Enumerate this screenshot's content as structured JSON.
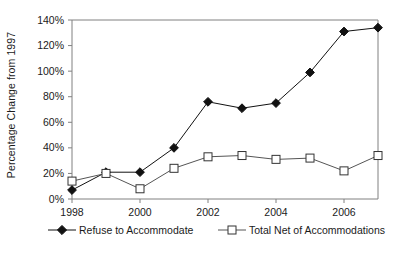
{
  "chart_data": {
    "type": "line",
    "title": "",
    "subtitle": "",
    "xlabel": "",
    "ylabel": "Percentage Change from 1997",
    "x": [
      1998,
      1999,
      2000,
      2001,
      2002,
      2003,
      2004,
      2005,
      2006,
      2007
    ],
    "xlim": [
      1998,
      2007
    ],
    "ylim": [
      0,
      140
    ],
    "ytick_labels": [
      "0%",
      "20%",
      "40%",
      "60%",
      "80%",
      "100%",
      "120%",
      "140%"
    ],
    "ytick_values": [
      0,
      20,
      40,
      60,
      80,
      100,
      120,
      140
    ],
    "xtick_labels": [
      "1998",
      "2000",
      "2002",
      "2004",
      "2006"
    ],
    "xtick_values": [
      1998,
      2000,
      2002,
      2004,
      2006
    ],
    "grid": false,
    "legend_position": "bottom",
    "series": [
      {
        "name": "Refuse to Accommodate",
        "marker": "filled-diamond",
        "color": "#111111",
        "values": [
          7,
          21,
          21,
          40,
          76,
          71,
          75,
          99,
          131,
          134
        ]
      },
      {
        "name": "Total Net of Accommodations",
        "marker": "open-square",
        "color": "#555555",
        "values": [
          14,
          20,
          8,
          24,
          33,
          34,
          31,
          32,
          22,
          34
        ]
      }
    ]
  },
  "legend": {
    "entries": [
      {
        "label": "Refuse to Accommodate"
      },
      {
        "label": "Total Net of Accommodations"
      }
    ]
  },
  "axis": {
    "y_title": "Percentage Change from 1997"
  }
}
